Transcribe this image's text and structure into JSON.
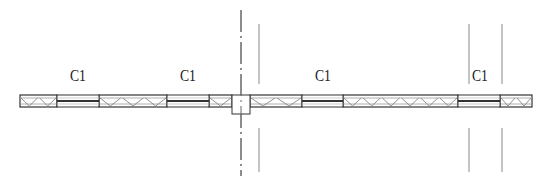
{
  "drawing": {
    "type": "architectural-floor-plan-wall-section",
    "wall": {
      "x_start": 20,
      "x_end": 532,
      "y_top": 95,
      "y_bottom": 107,
      "stroke": "#333333"
    },
    "windows": [
      {
        "label": "C1",
        "x_start": 57,
        "x_end": 99
      },
      {
        "label": "C1",
        "x_start": 167,
        "x_end": 209
      },
      {
        "label": "C1",
        "x_start": 302,
        "x_end": 343
      },
      {
        "label": "C1",
        "x_start": 458,
        "x_end": 500
      }
    ],
    "insulated_wall_segments": [
      {
        "x_start": 20,
        "x_end": 57,
        "triangles": 2
      },
      {
        "x_start": 99,
        "x_end": 167,
        "triangles": 3
      },
      {
        "x_start": 209,
        "x_end": 232,
        "triangles": 1
      },
      {
        "x_start": 250,
        "x_end": 302,
        "triangles": 2
      },
      {
        "x_start": 343,
        "x_end": 458,
        "triangles": 6
      },
      {
        "x_start": 500,
        "x_end": 532,
        "triangles": 2
      }
    ],
    "column": {
      "x_start": 232,
      "x_end": 250,
      "y_top": 95,
      "y_bottom": 114
    },
    "axis_line": {
      "x": 241,
      "y_start": 10,
      "y_end": 176,
      "style": "dash-dot"
    },
    "guide_lines": [
      {
        "x": 259,
        "segments": [
          [
            24,
            84
          ],
          [
            128,
            172
          ]
        ]
      },
      {
        "x": 469,
        "segments": [
          [
            24,
            84
          ],
          [
            128,
            172
          ]
        ]
      },
      {
        "x": 502,
        "segments": [
          [
            24,
            84
          ],
          [
            128,
            172
          ]
        ]
      }
    ]
  },
  "labels": {
    "c1_a": "C1",
    "c1_b": "C1",
    "c1_c": "C1",
    "c1_d": "C1"
  }
}
